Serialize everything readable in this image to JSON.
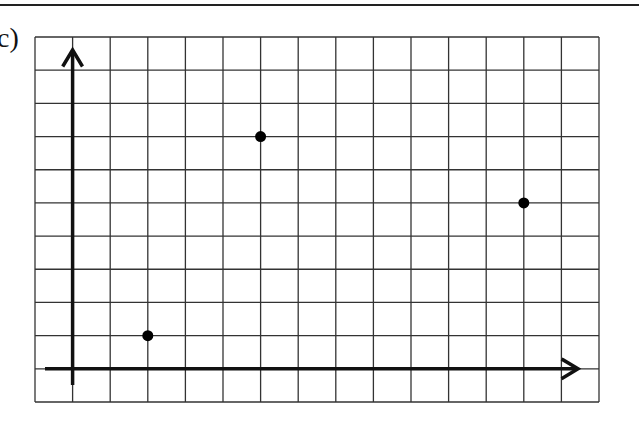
{
  "label": "c)",
  "grid": {
    "left": 35,
    "top": 37,
    "right": 599,
    "bottom": 402,
    "columns": 15,
    "rows": 11,
    "line_color": "#333333",
    "axis_color": "#111111"
  },
  "axes": {
    "origin_col": 1,
    "origin_row": 10,
    "x_axis_end_x": 578,
    "x_axis_start_x": 45,
    "y_axis_top_y": 50,
    "y_axis_bottom_y": 385
  },
  "chart_data": {
    "type": "scatter",
    "title": "c)",
    "xlabel": "",
    "ylabel": "",
    "points": [
      {
        "x": 2,
        "y": 1
      },
      {
        "x": 5,
        "y": 7
      },
      {
        "x": 12,
        "y": 5
      }
    ],
    "xlim": [
      -1,
      14
    ],
    "ylim": [
      -1,
      10
    ],
    "grid": true
  }
}
